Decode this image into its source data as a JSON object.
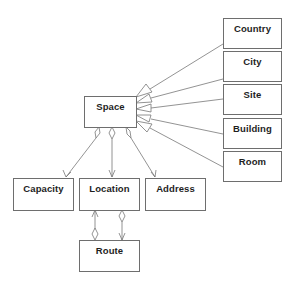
{
  "diagram": {
    "type": "uml-class-diagram",
    "classes": {
      "space": "Space",
      "country": "Country",
      "city": "City",
      "site": "Site",
      "building": "Building",
      "room": "Room",
      "capacity": "Capacity",
      "location": "Location",
      "address": "Address",
      "route": "Route"
    },
    "relationships": [
      {
        "from": "Country",
        "to": "Space",
        "type": "generalization"
      },
      {
        "from": "City",
        "to": "Space",
        "type": "generalization"
      },
      {
        "from": "Site",
        "to": "Space",
        "type": "generalization"
      },
      {
        "from": "Building",
        "to": "Space",
        "type": "generalization"
      },
      {
        "from": "Room",
        "to": "Space",
        "type": "generalization"
      },
      {
        "from": "Space",
        "to": "Capacity",
        "type": "aggregation-navigable"
      },
      {
        "from": "Space",
        "to": "Location",
        "type": "aggregation-navigable"
      },
      {
        "from": "Space",
        "to": "Address",
        "type": "aggregation-navigable"
      },
      {
        "from": "Route",
        "to": "Location",
        "type": "aggregation-navigable"
      },
      {
        "from": "Location",
        "to": "Route",
        "type": "aggregation-navigable"
      }
    ],
    "colors": {
      "line": "#6e6e6e",
      "text": "#1e1e1e",
      "background": "#ffffff"
    }
  }
}
